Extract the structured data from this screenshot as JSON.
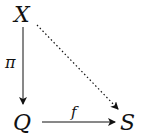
{
  "diagram": {
    "type": "commutative-diagram",
    "nodes": [
      {
        "id": "X",
        "label": "X"
      },
      {
        "id": "Q",
        "label": "Q"
      },
      {
        "id": "S",
        "label": "S"
      }
    ],
    "edges": [
      {
        "from": "X",
        "to": "Q",
        "label": "π",
        "style": "solid"
      },
      {
        "from": "Q",
        "to": "S",
        "label": "f",
        "style": "solid"
      },
      {
        "from": "X",
        "to": "S",
        "label": "",
        "style": "dotted"
      }
    ],
    "colors": {
      "ink": "#111111",
      "background": "#ffffff"
    }
  }
}
